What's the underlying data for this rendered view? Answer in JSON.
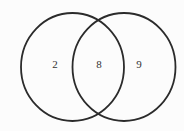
{
  "diagram": {
    "type": "venn-two-set",
    "left_value": "2",
    "intersection_value": "8",
    "right_value": "9",
    "stroke_color": "#2b2b2b",
    "text_color": "#333333",
    "background_color": "#fcfcfc"
  }
}
